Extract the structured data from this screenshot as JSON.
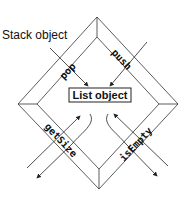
{
  "diagram": {
    "outer_label": "Stack object",
    "inner_label": "List object",
    "operations": {
      "pop": "pop",
      "push": "push",
      "getSize": "getSize",
      "isEmpty": "isEmpty"
    },
    "colors": {
      "line": "#222222",
      "background": "#ffffff"
    }
  }
}
